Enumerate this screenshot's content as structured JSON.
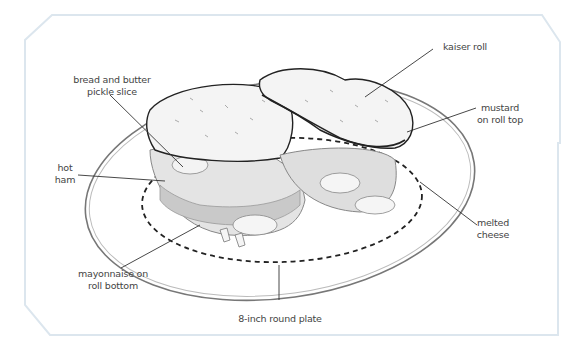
{
  "diagram": {
    "frame_color": "#dce6ee",
    "labels": {
      "pickle": "bread and butter\npickle slice",
      "pickle_line1": "bread and butter",
      "pickle_line2": "pickle slice",
      "ham_line1": "hot",
      "ham_line2": "ham",
      "kaiser": "kaiser roll",
      "mustard_line1": "mustard",
      "mustard_line2": "on roll top",
      "cheese_line1": "melted",
      "cheese_line2": "cheese",
      "mayo_line1": "mayonnaise on",
      "mayo_line2": "roll bottom",
      "plate": "8-inch round plate"
    }
  }
}
